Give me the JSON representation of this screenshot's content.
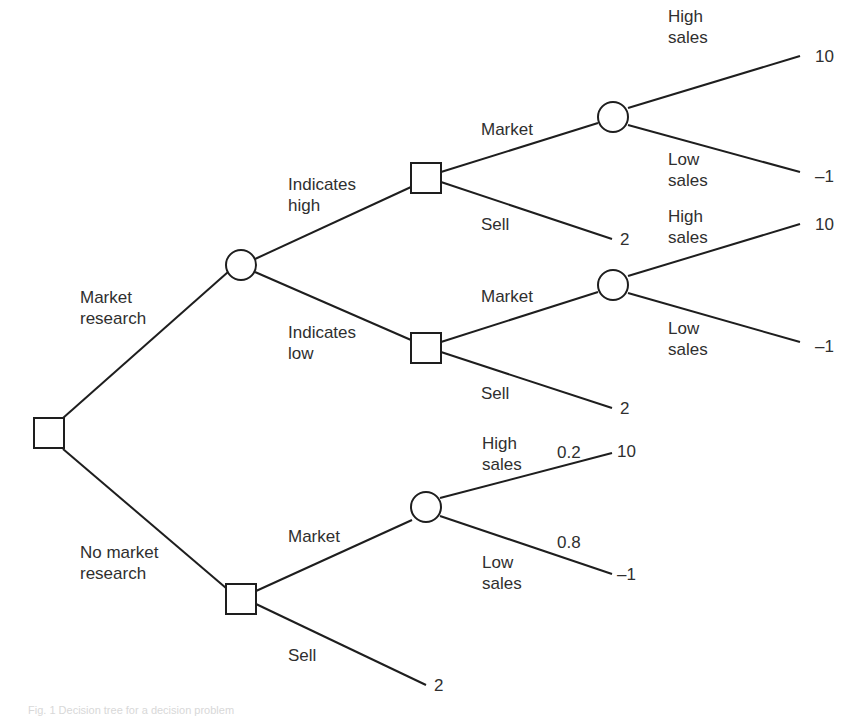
{
  "diagram": {
    "type": "decision-tree",
    "colors": {
      "line": "#1e1e1e",
      "text": "#2f2f2f",
      "background": "#ffffff"
    },
    "root": {
      "shape": "square",
      "name": "root-decision"
    },
    "branches": {
      "market_research": "Market\nresearch",
      "no_market_research": "No market\nresearch",
      "indicates_high": "Indicates\nhigh",
      "indicates_low": "Indicates\nlow",
      "market_1": "Market",
      "market_2": "Market",
      "market_3": "Market",
      "sell_1": "Sell",
      "sell_2": "Sell",
      "sell_3": "Sell",
      "high_sales_1": "High\nsales",
      "low_sales_1": "Low\nsales",
      "high_sales_2": "High\nsales",
      "low_sales_2": "Low\nsales",
      "high_sales_3": "High\nsales",
      "low_sales_3": "Low\nsales"
    },
    "probabilities": {
      "high_sales_3": "0.2",
      "low_sales_3": "0.8"
    },
    "payoffs": {
      "p1": "10",
      "p2": "–1",
      "p3": "2",
      "p4": "10",
      "p5": "–1",
      "p6": "2",
      "p7": "10",
      "p8": "–1",
      "p9": "2"
    },
    "caption": "Fig. 1  Decision tree for a decision problem"
  }
}
